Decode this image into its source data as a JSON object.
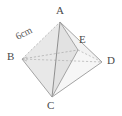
{
  "figure": {
    "title": "",
    "shape_name": "octahedron",
    "background_color": "#ffffff",
    "face_fill_color": "#e8e8e8",
    "face_fill_color_dark": "#dcdcdc",
    "edge_color": "#9a9a9a",
    "hidden_edge_color": "#b8b8b8",
    "label_color": "#4a4a4a",
    "vertices": [
      {
        "name": "A",
        "label": "A",
        "x": 60,
        "y": 22,
        "label_x": 56,
        "label_y": 6
      },
      {
        "name": "B",
        "label": "B",
        "x": 22,
        "y": 59,
        "label_x": 8,
        "label_y": 52
      },
      {
        "name": "C",
        "label": "C",
        "x": 52,
        "y": 97,
        "label_x": 47,
        "label_y": 100
      },
      {
        "name": "D",
        "label": "D",
        "x": 102,
        "y": 62,
        "label_x": 107,
        "label_y": 56
      },
      {
        "name": "E",
        "label": "E",
        "x": 78,
        "y": 50,
        "label_x": 80,
        "label_y": 36
      }
    ],
    "edges": [
      {
        "from": "A",
        "to": "B",
        "style": "dashed"
      },
      {
        "from": "A",
        "to": "C",
        "style": "solid"
      },
      {
        "from": "A",
        "to": "D",
        "style": "solid"
      },
      {
        "from": "A",
        "to": "E",
        "style": "solid"
      },
      {
        "from": "B",
        "to": "C",
        "style": "solid"
      },
      {
        "from": "B",
        "to": "D",
        "style": "dashed"
      },
      {
        "from": "B",
        "to": "E",
        "style": "dashed"
      },
      {
        "from": "C",
        "to": "D",
        "style": "solid"
      },
      {
        "from": "C",
        "to": "E",
        "style": "solid"
      },
      {
        "from": "E",
        "to": "D",
        "style": "dashed"
      }
    ],
    "dimensions": [
      {
        "name": "edge-ab-length",
        "label": "6cm",
        "on_edge": "A-B",
        "x": 14,
        "y": 40
      }
    ]
  }
}
